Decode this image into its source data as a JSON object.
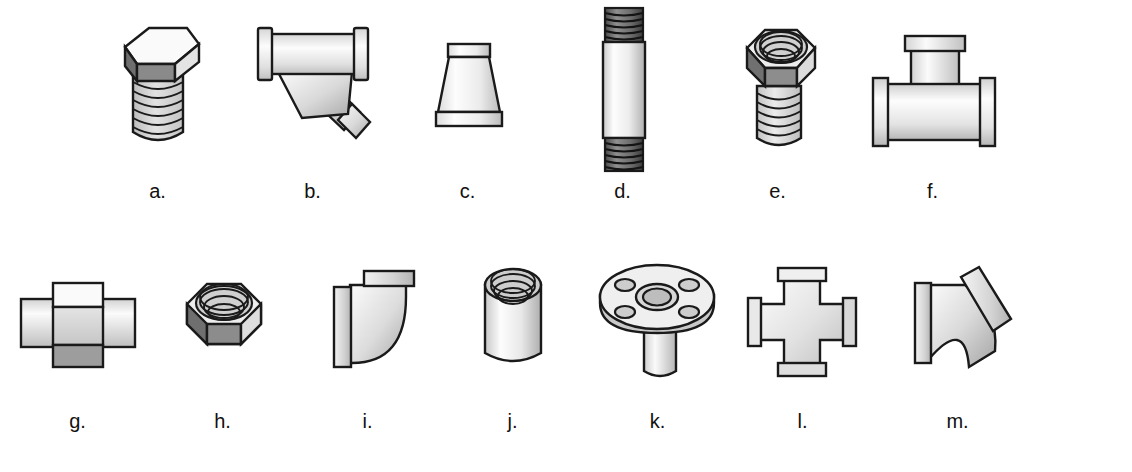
{
  "figure": {
    "background_color": "#ffffff",
    "line_color": "#1a1a1a",
    "fill_light": "#f2f2f2",
    "fill_mid": "#d9d9d9",
    "fill_dark": "#8c8c8c",
    "fill_darker": "#6b6b6b"
  },
  "rows": [
    {
      "items": [
        {
          "label": "a.",
          "icon": "hex-head-plug-icon",
          "name": "fitting-hex-plug"
        },
        {
          "label": "b.",
          "icon": "wye-strainer-icon",
          "name": "fitting-wye"
        },
        {
          "label": "c.",
          "icon": "reducer-icon",
          "name": "fitting-reducer"
        },
        {
          "label": "d.",
          "icon": "threaded-nipple-icon",
          "name": "fitting-nipple"
        },
        {
          "label": "e.",
          "icon": "hex-bushing-icon",
          "name": "fitting-bushing"
        },
        {
          "label": "f.",
          "icon": "tee-icon",
          "name": "fitting-tee"
        }
      ]
    },
    {
      "items": [
        {
          "label": "g.",
          "icon": "union-icon",
          "name": "fitting-union"
        },
        {
          "label": "h.",
          "icon": "hex-cap-icon",
          "name": "fitting-hex-cap"
        },
        {
          "label": "i.",
          "icon": "elbow-90-icon",
          "name": "fitting-elbow-90"
        },
        {
          "label": "j.",
          "icon": "coupling-icon",
          "name": "fitting-coupling"
        },
        {
          "label": "k.",
          "icon": "flange-icon",
          "name": "fitting-flange"
        },
        {
          "label": "l.",
          "icon": "cross-icon",
          "name": "fitting-cross"
        },
        {
          "label": "m.",
          "icon": "elbow-45-icon",
          "name": "fitting-elbow-45"
        }
      ]
    }
  ],
  "layout": {
    "row1_positions": [
      60,
      215,
      370,
      525,
      680,
      835
    ],
    "row1_width": 235,
    "row2_positions": [
      5,
      150,
      295,
      440,
      585,
      730,
      885
    ],
    "row2_width": 230
  }
}
